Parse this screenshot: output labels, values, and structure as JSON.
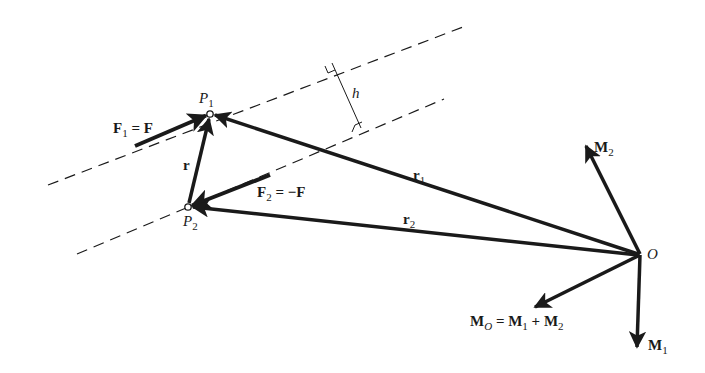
{
  "figure": {
    "stroke_color": "#1a1a1a",
    "background": "#ffffff"
  },
  "points": {
    "P1": {
      "label": "P",
      "sub": "1"
    },
    "P2": {
      "label": "P",
      "sub": "2"
    },
    "O": {
      "label": "O"
    }
  },
  "labels": {
    "F1": {
      "main": "F",
      "sub": "1",
      "rest": " = F"
    },
    "F2": {
      "main": "F",
      "sub": "2",
      "rest": " = −F"
    },
    "r": {
      "main": "r"
    },
    "r1": {
      "main": "r",
      "sub": "1"
    },
    "r2": {
      "main": "r",
      "sub": "2"
    },
    "h": {
      "main": "h"
    },
    "M1": {
      "main": "M",
      "sub": "1"
    },
    "M2": {
      "main": "M",
      "sub": "2"
    },
    "MO": {
      "main": "M",
      "sub": "O",
      "eq": " = ",
      "t1": "M",
      "t1sub": "1",
      "plus": " + ",
      "t2": "M",
      "t2sub": "2"
    }
  }
}
